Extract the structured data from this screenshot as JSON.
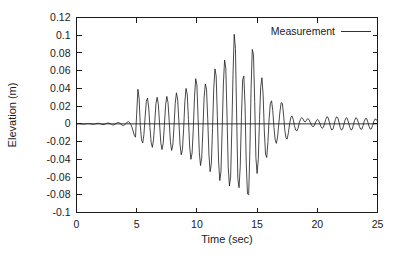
{
  "chart_data": {
    "type": "line",
    "title": "",
    "xlabel": "Time (sec)",
    "ylabel": "Elevation (m)",
    "xlim": [
      0,
      25
    ],
    "ylim": [
      -0.1,
      0.12
    ],
    "xticks": [
      "0",
      "5",
      "10",
      "15",
      "20",
      "25"
    ],
    "xtick_values": [
      0,
      5,
      10,
      15,
      20,
      25
    ],
    "yticks": [
      "0.12",
      "0.1",
      "0.08",
      "0.06",
      "0.04",
      "0.02",
      "0",
      "-0.02",
      "-0.04",
      "-0.06",
      "-0.08",
      "-0.1"
    ],
    "ytick_values": [
      0.12,
      0.1,
      0.08,
      0.06,
      0.04,
      0.02,
      0,
      -0.02,
      -0.04,
      -0.06,
      -0.08,
      -0.1
    ],
    "grid": false,
    "legend_position": "top-right-inside",
    "legend": [
      "Measurement"
    ],
    "line_color": "#1a1a1a",
    "series": [
      {
        "name": "Measurement",
        "x": [
          0.0,
          0.1,
          0.2,
          0.3,
          0.4,
          0.5,
          0.6,
          0.7,
          0.8,
          0.9,
          1.0,
          1.1,
          1.2,
          1.3,
          1.4,
          1.5,
          1.6,
          1.7,
          1.8,
          1.9,
          2.0,
          2.1,
          2.2,
          2.3,
          2.4,
          2.5,
          2.6,
          2.7,
          2.8,
          2.9,
          3.0,
          3.1,
          3.2,
          3.3,
          3.4,
          3.5,
          3.6,
          3.7,
          3.8,
          3.9,
          4.0,
          4.1,
          4.2,
          4.3,
          4.4,
          4.5,
          4.6,
          4.7,
          4.8,
          4.9,
          5.0,
          5.1,
          5.2,
          5.3,
          5.4,
          5.5,
          5.6,
          5.7,
          5.8,
          5.9,
          6.0,
          6.1,
          6.2,
          6.3,
          6.4,
          6.5,
          6.6,
          6.7,
          6.8,
          6.9,
          7.0,
          7.1,
          7.2,
          7.3,
          7.4,
          7.5,
          7.6,
          7.7,
          7.8,
          7.9,
          8.0,
          8.1,
          8.2,
          8.3,
          8.4,
          8.5,
          8.6,
          8.7,
          8.8,
          8.9,
          9.0,
          9.1,
          9.2,
          9.3,
          9.4,
          9.5,
          9.6,
          9.7,
          9.8,
          9.9,
          10.0,
          10.1,
          10.2,
          10.3,
          10.4,
          10.5,
          10.6,
          10.7,
          10.8,
          10.9,
          11.0,
          11.1,
          11.2,
          11.3,
          11.4,
          11.5,
          11.6,
          11.7,
          11.8,
          11.9,
          12.0,
          12.1,
          12.2,
          12.3,
          12.4,
          12.5,
          12.6,
          12.7,
          12.8,
          12.9,
          13.0,
          13.1,
          13.2,
          13.3,
          13.4,
          13.5,
          13.6,
          13.7,
          13.8,
          13.9,
          14.0,
          14.1,
          14.2,
          14.3,
          14.4,
          14.5,
          14.6,
          14.7,
          14.8,
          14.9,
          15.0,
          15.1,
          15.2,
          15.3,
          15.4,
          15.5,
          15.6,
          15.7,
          15.8,
          15.9,
          16.0,
          16.1,
          16.2,
          16.3,
          16.4,
          16.5,
          16.6,
          16.7,
          16.8,
          16.9,
          17.0,
          17.1,
          17.2,
          17.3,
          17.4,
          17.5,
          17.6,
          17.7,
          17.8,
          17.9,
          18.0,
          18.1,
          18.2,
          18.3,
          18.4,
          18.5,
          18.6,
          18.7,
          18.8,
          18.9,
          19.0,
          19.1,
          19.2,
          19.3,
          19.4,
          19.5,
          19.6,
          19.7,
          19.8,
          19.9,
          20.0,
          20.1,
          20.2,
          20.3,
          20.4,
          20.5,
          20.6,
          20.7,
          20.8,
          20.9,
          21.0,
          21.1,
          21.2,
          21.3,
          21.4,
          21.5,
          21.6,
          21.7,
          21.8,
          21.9,
          22.0,
          22.1,
          22.2,
          22.3,
          22.4,
          22.5,
          22.6,
          22.7,
          22.8,
          22.9,
          23.0,
          23.1,
          23.2,
          23.3,
          23.4,
          23.5,
          23.6,
          23.7,
          23.8,
          23.9,
          24.0,
          24.1,
          24.2,
          24.3,
          24.4,
          24.5,
          24.6,
          24.7,
          24.8,
          24.9,
          25.0
        ],
        "values": [
          0.0,
          0.0002,
          0.0004,
          0.0003,
          0.0,
          -0.0003,
          -0.0004,
          -0.0002,
          0.0001,
          0.0004,
          0.0005,
          0.0003,
          -0.0001,
          -0.0004,
          -0.0005,
          -0.0003,
          0.0001,
          0.0005,
          0.0007,
          0.0005,
          0.0,
          -0.0005,
          -0.0008,
          -0.0006,
          -0.0001,
          0.0006,
          0.001,
          0.0008,
          0.0002,
          -0.0006,
          -0.0012,
          -0.0011,
          -0.0004,
          0.0006,
          0.0014,
          0.0015,
          0.0007,
          -0.0005,
          -0.0016,
          -0.0019,
          -0.0011,
          0.0004,
          0.0019,
          0.0024,
          0.0016,
          -0.0002,
          -0.0035,
          -0.008,
          -0.013,
          -0.015,
          0.012,
          0.039,
          0.029,
          -0.002,
          -0.018,
          -0.0215,
          -0.012,
          0.008,
          0.0255,
          0.029,
          0.018,
          -0.004,
          -0.021,
          -0.0265,
          -0.018,
          0.002,
          0.023,
          0.03,
          0.0215,
          0.0,
          -0.021,
          -0.029,
          -0.022,
          -0.002,
          0.0215,
          0.031,
          0.024,
          0.003,
          -0.02,
          -0.03,
          -0.024,
          -0.003,
          0.023,
          0.035,
          0.028,
          0.004,
          -0.023,
          -0.035,
          -0.029,
          -0.005,
          0.025,
          0.04,
          0.033,
          0.005,
          -0.026,
          -0.04,
          -0.033,
          -0.006,
          0.03,
          0.051,
          0.044,
          0.006,
          -0.032,
          -0.047,
          -0.038,
          -0.006,
          0.03,
          0.045,
          0.039,
          0.005,
          -0.035,
          -0.054,
          -0.045,
          -0.005,
          0.04,
          0.062,
          0.054,
          0.008,
          -0.042,
          -0.064,
          -0.054,
          -0.006,
          0.045,
          0.072,
          0.063,
          0.01,
          -0.048,
          -0.07,
          -0.06,
          -0.006,
          0.056,
          0.101,
          0.085,
          0.01,
          -0.062,
          -0.072,
          -0.048,
          0.008,
          0.05,
          0.054,
          0.02,
          -0.045,
          -0.079,
          -0.08,
          -0.03,
          0.04,
          0.084,
          0.078,
          0.025,
          -0.038,
          -0.056,
          -0.04,
          0.005,
          0.042,
          0.052,
          0.033,
          -0.008,
          -0.034,
          -0.038,
          -0.02,
          0.006,
          0.023,
          0.026,
          0.015,
          -0.004,
          -0.018,
          -0.022,
          -0.015,
          0.0,
          0.014,
          0.024,
          0.023,
          0.01,
          -0.007,
          -0.016,
          -0.017,
          -0.01,
          0.0,
          0.007,
          0.009,
          0.005,
          -0.002,
          -0.007,
          -0.008,
          -0.005,
          0.001,
          0.005,
          0.007,
          0.006,
          0.003,
          0.002,
          0.004,
          0.006,
          0.005,
          0.002,
          -0.001,
          -0.003,
          -0.003,
          0.0,
          0.003,
          0.005,
          0.004,
          0.001,
          -0.003,
          -0.005,
          -0.004,
          0.0,
          0.005,
          0.008,
          0.007,
          0.002,
          -0.004,
          -0.007,
          -0.006,
          -0.001,
          0.005,
          0.008,
          0.007,
          0.002,
          -0.004,
          -0.007,
          -0.006,
          -0.001,
          0.004,
          0.007,
          0.006,
          0.001,
          -0.004,
          -0.007,
          -0.006,
          -0.001,
          0.004,
          0.007,
          0.006,
          0.002,
          -0.003,
          -0.006,
          -0.006,
          -0.002,
          0.003,
          0.006,
          0.006,
          0.002,
          -0.003,
          -0.006,
          -0.0055,
          -0.0015,
          0.003,
          0.0055,
          0.005,
          0.003
        ]
      }
    ]
  }
}
